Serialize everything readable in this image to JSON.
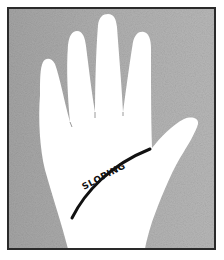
{
  "figure": {
    "line_label": "SLOPING",
    "colors": {
      "background": "#ffffff",
      "frame_fill": "#a9a9a9",
      "frame_border": "#2a2a2a",
      "hand_fill": "#ffffff",
      "line_color": "#111111",
      "text_color": "#111111"
    }
  }
}
